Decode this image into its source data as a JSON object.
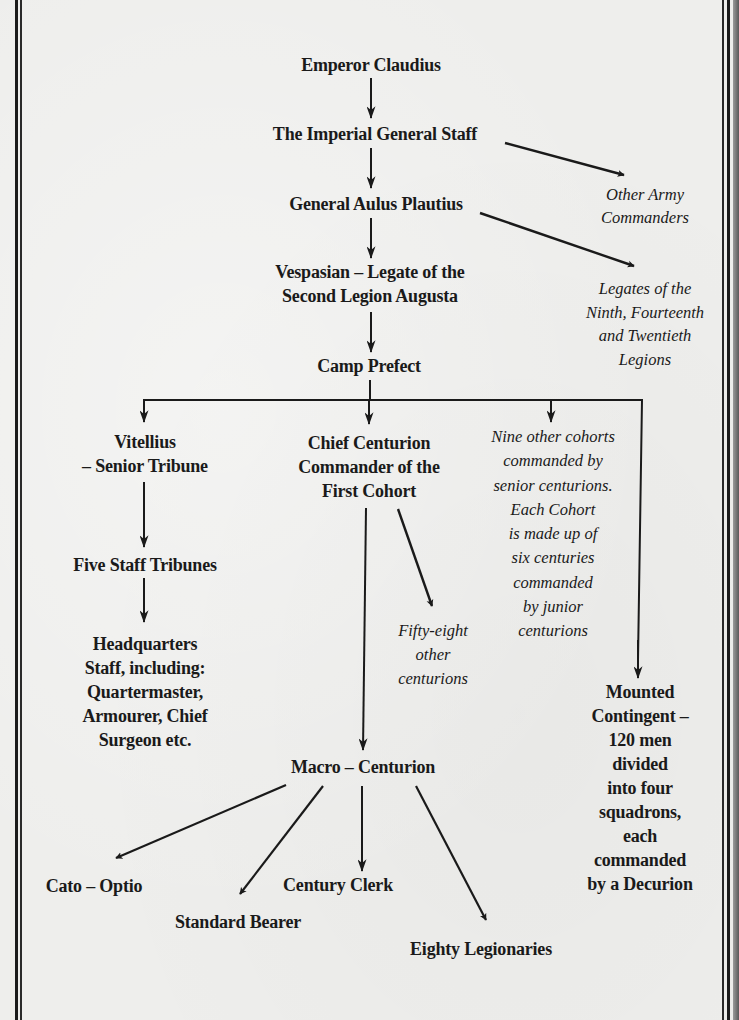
{
  "diagram": {
    "type": "organizational-chart",
    "nodes": {
      "emperor": {
        "lines": [
          "Emperor Claudius"
        ]
      },
      "general_staff": {
        "lines": [
          "The Imperial General Staff"
        ]
      },
      "other_commanders": {
        "lines": [
          "Other Army",
          "Commanders"
        ]
      },
      "plautius": {
        "lines": [
          "General Aulus Plautius"
        ]
      },
      "other_legates": {
        "lines": [
          "Legates of the",
          "Ninth, Fourteenth",
          "and Twentieth",
          "Legions"
        ]
      },
      "vespasian": {
        "lines": [
          "Vespasian – Legate of the",
          "Second Legion Augusta"
        ]
      },
      "camp_prefect": {
        "lines": [
          "Camp Prefect"
        ]
      },
      "vitellius": {
        "lines": [
          "Vitellius",
          "– Senior Tribune"
        ]
      },
      "chief_centurion": {
        "lines": [
          "Chief Centurion",
          "Commander of the",
          "First Cohort"
        ]
      },
      "other_cohorts": {
        "lines": [
          "Nine other cohorts",
          "commanded by",
          "senior centurions.",
          "Each Cohort",
          "is made up of",
          "six centuries",
          "commanded",
          "by junior",
          "centurions"
        ]
      },
      "staff_tribunes": {
        "lines": [
          "Five Staff Tribunes"
        ]
      },
      "headquarters": {
        "lines": [
          "Headquarters",
          "Staff, including:",
          "Quartermaster,",
          "Armourer, Chief",
          "Surgeon etc."
        ]
      },
      "other_centurions": {
        "lines": [
          "Fifty-eight",
          "other",
          "centurions"
        ]
      },
      "mounted": {
        "lines": [
          "Mounted",
          "Contingent –",
          "120 men",
          "divided",
          "into four",
          "squadrons,",
          "each",
          "commanded",
          "by a Decurion"
        ]
      },
      "macro": {
        "lines": [
          "Macro – Centurion"
        ]
      },
      "cato": {
        "lines": [
          "Cato – Optio"
        ]
      },
      "standard_bearer": {
        "lines": [
          "Standard Bearer"
        ]
      },
      "century_clerk": {
        "lines": [
          "Century Clerk"
        ]
      },
      "legionaries": {
        "lines": [
          "Eighty Legionaries"
        ]
      }
    },
    "edges": [
      [
        "emperor",
        "general_staff"
      ],
      [
        "general_staff",
        "plautius"
      ],
      [
        "general_staff",
        "other_commanders"
      ],
      [
        "plautius",
        "vespasian"
      ],
      [
        "plautius",
        "other_legates"
      ],
      [
        "vespasian",
        "camp_prefect"
      ],
      [
        "camp_prefect",
        "vitellius"
      ],
      [
        "camp_prefect",
        "chief_centurion"
      ],
      [
        "camp_prefect",
        "other_cohorts"
      ],
      [
        "camp_prefect",
        "mounted"
      ],
      [
        "vitellius",
        "staff_tribunes"
      ],
      [
        "staff_tribunes",
        "headquarters"
      ],
      [
        "chief_centurion",
        "other_centurions"
      ],
      [
        "chief_centurion",
        "macro"
      ],
      [
        "macro",
        "cato"
      ],
      [
        "macro",
        "standard_bearer"
      ],
      [
        "macro",
        "century_clerk"
      ],
      [
        "macro",
        "legionaries"
      ]
    ]
  },
  "style": {
    "ink_color": "#1a1a1a",
    "paper_color": "#eeeeec"
  }
}
